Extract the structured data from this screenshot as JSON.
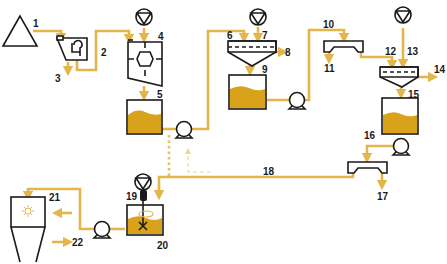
{
  "diagram": {
    "type": "process-flow",
    "colors": {
      "pipe": "#e3b54a",
      "liquid": "#d9a21b",
      "outline": "#1a1a1a",
      "background": "#ffffff"
    },
    "labels": {
      "n1": "1",
      "n2": "2",
      "n3": "3",
      "n4": "4",
      "n5": "5",
      "n6": "6",
      "n7": "7",
      "n8": "8",
      "n9": "9",
      "n10": "10",
      "n11": "11",
      "n12": "12",
      "n13": "13",
      "n14": "14",
      "n15": "15",
      "n16": "16",
      "n17": "17",
      "n18": "18",
      "n19": "19",
      "n20": "20",
      "n21": "21",
      "n22": "22"
    },
    "nodes": [
      {
        "id": "1",
        "shape": "triangle-feed"
      },
      {
        "id": "3",
        "shape": "screen-separator"
      },
      {
        "id": "4",
        "shape": "agitated-reactor",
        "dosing": "dosing-pump"
      },
      {
        "id": "5",
        "shape": "tank"
      },
      {
        "id": "6",
        "shape": "settler",
        "dosing": "dosing-pump"
      },
      {
        "id": "9",
        "shape": "tank"
      },
      {
        "id": "10",
        "shape": "filter-trough"
      },
      {
        "id": "12",
        "shape": "settler",
        "dosing": "dosing-pump"
      },
      {
        "id": "15",
        "shape": "tank"
      },
      {
        "id": "17",
        "shape": "filter-trough"
      },
      {
        "id": "19",
        "shape": "mixing-tank",
        "dosing": "dosing-pump"
      },
      {
        "id": "21",
        "shape": "spray-dryer"
      }
    ]
  }
}
